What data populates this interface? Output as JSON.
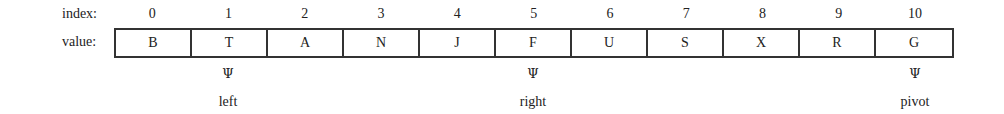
{
  "labels": {
    "index": "index:",
    "value": "value:"
  },
  "array": {
    "indices": [
      "0",
      "1",
      "2",
      "3",
      "4",
      "5",
      "6",
      "7",
      "8",
      "9",
      "10"
    ],
    "values": [
      "B",
      "T",
      "A",
      "N",
      "J",
      "F",
      "U",
      "S",
      "X",
      "R",
      "G"
    ]
  },
  "pointers": [
    {
      "name": "left",
      "index": 1,
      "glyph": "Ψ"
    },
    {
      "name": "right",
      "index": 5,
      "glyph": "Ψ"
    },
    {
      "name": "pivot",
      "index": 10,
      "glyph": "Ψ"
    }
  ]
}
